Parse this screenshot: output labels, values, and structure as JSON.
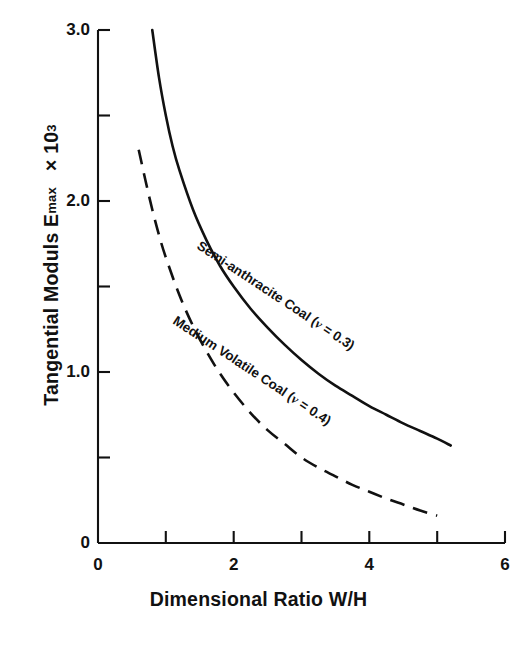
{
  "chart_data": {
    "type": "line",
    "title": "",
    "xlabel": "Dimensional Ratio  W/H",
    "ylabel": "Tangential Moduls E_max  × 10³",
    "ylabel_parts": {
      "main": "Tangential Moduls E",
      "subscript": "max",
      "multiplier": "× 10",
      "exponent": "3"
    },
    "xlim": [
      0,
      6
    ],
    "ylim": [
      0,
      3.0
    ],
    "grid": false,
    "legend_position": "inline-curve-labels",
    "x_ticks": [
      0,
      1,
      2,
      3,
      4,
      5,
      6
    ],
    "x_tick_labels": [
      "0",
      "",
      "2",
      "",
      "4",
      "",
      "6"
    ],
    "y_ticks": [
      0,
      0.5,
      1.0,
      1.5,
      2.0,
      2.5,
      3.0
    ],
    "y_tick_labels": [
      "0",
      "",
      "1.0",
      "",
      "2.0",
      "",
      "3.0"
    ],
    "series": [
      {
        "name": "Semi-anthracite Coal (ν = 0.3)",
        "label_text_plain": "Semi-anthracite Coal (",
        "label_nu": "ν",
        "label_value": " = 0.3)",
        "style": "solid",
        "color": "#111111",
        "x": [
          0.8,
          0.9,
          1.0,
          1.1,
          1.2,
          1.4,
          1.6,
          1.8,
          2.0,
          2.25,
          2.5,
          2.75,
          3.0,
          3.25,
          3.5,
          3.75,
          4.0,
          4.25,
          4.5,
          4.75,
          5.0,
          5.2
        ],
        "y": [
          3.0,
          2.72,
          2.5,
          2.32,
          2.18,
          1.95,
          1.77,
          1.62,
          1.5,
          1.37,
          1.26,
          1.16,
          1.07,
          0.99,
          0.92,
          0.86,
          0.8,
          0.75,
          0.7,
          0.655,
          0.61,
          0.57
        ]
      },
      {
        "name": "Medium Volatile Coal (ν = 0.4)",
        "label_text_plain": "Medium Volatile Coal (",
        "label_nu": "ν",
        "label_value": " = 0.4)",
        "style": "dashed",
        "color": "#111111",
        "x": [
          0.6,
          0.7,
          0.8,
          0.9,
          1.0,
          1.2,
          1.4,
          1.6,
          1.8,
          2.0,
          2.25,
          2.5,
          2.75,
          3.0,
          3.25,
          3.5,
          3.75,
          4.0,
          4.25,
          4.5,
          4.75,
          5.0
        ],
        "y": [
          2.3,
          2.12,
          1.95,
          1.8,
          1.67,
          1.45,
          1.27,
          1.12,
          0.99,
          0.88,
          0.76,
          0.66,
          0.58,
          0.5,
          0.44,
          0.39,
          0.34,
          0.3,
          0.26,
          0.225,
          0.19,
          0.16
        ]
      }
    ],
    "curve_label_1": "Semi-anthracite Coal ( = 0.3)",
    "curve_label_2": "Medium Volatile Coal ( = 0.4)"
  },
  "axes": {
    "x_title": "Dimensional Ratio  W/H",
    "y_title_main": "Tangential Moduls E",
    "y_title_sub": "max",
    "y_title_mult": "× 10",
    "y_title_exp": "3",
    "x_tick_0": "0",
    "x_tick_2": "2",
    "x_tick_4": "4",
    "x_tick_6": "6",
    "y_tick_0": "0",
    "y_tick_1": "1.0",
    "y_tick_2": "2.0",
    "y_tick_3": "3.0"
  },
  "labels": {
    "semi_prefix": "Semi-anthracite Coal (",
    "semi_nu": "ν",
    "semi_suffix": " = 0.3)",
    "medium_prefix": "Medium Volatile Coal (",
    "medium_nu": "ν",
    "medium_suffix": " = 0.4)"
  }
}
